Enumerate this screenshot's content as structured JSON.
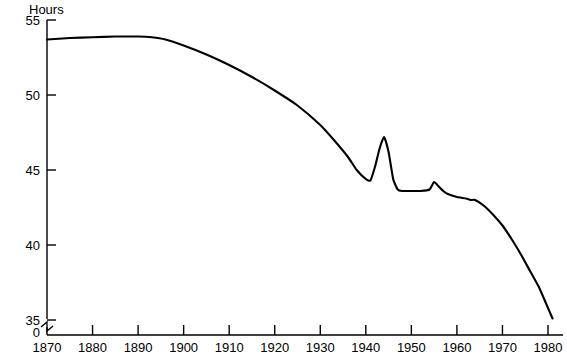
{
  "chart_data": {
    "type": "line",
    "title": "",
    "xlabel": "",
    "ylabel": "Hours",
    "xlim": [
      1870,
      1982
    ],
    "ylim": [
      35,
      55
    ],
    "grid": false,
    "legend": false,
    "axis_break": true,
    "axis_break_label": "0",
    "xticks": [
      1870,
      1880,
      1890,
      1900,
      1910,
      1920,
      1930,
      1940,
      1950,
      1960,
      1970,
      1980
    ],
    "xticklabels": [
      "1870",
      "1880",
      "1890",
      "1900",
      "1910",
      "1920",
      "1930",
      "1940",
      "1950",
      "1960",
      "1970",
      "1980"
    ],
    "yticks": [
      35,
      40,
      45,
      50,
      55
    ],
    "yticklabels": [
      "35",
      "40",
      "45",
      "50",
      "55"
    ],
    "series": [
      {
        "name": "Average weekly hours",
        "color": "#000000",
        "x": [
          1870,
          1875,
          1880,
          1885,
          1890,
          1893,
          1896,
          1900,
          1905,
          1910,
          1915,
          1920,
          1925,
          1930,
          1933,
          1936,
          1938,
          1940,
          1941,
          1942,
          1943,
          1944,
          1945,
          1946,
          1947,
          1948,
          1950,
          1952,
          1954,
          1955,
          1956,
          1957,
          1958,
          1960,
          1962,
          1963,
          1964,
          1966,
          1968,
          1970,
          1972,
          1974,
          1976,
          1978,
          1980,
          1981
        ],
        "y": [
          53.7,
          53.8,
          53.85,
          53.9,
          53.9,
          53.85,
          53.7,
          53.3,
          52.7,
          52.0,
          51.2,
          50.3,
          49.3,
          48.0,
          47.0,
          45.9,
          45.0,
          44.4,
          44.3,
          45.2,
          46.4,
          47.2,
          46.2,
          44.4,
          43.7,
          43.6,
          43.6,
          43.6,
          43.7,
          44.2,
          43.9,
          43.6,
          43.4,
          43.2,
          43.1,
          43.0,
          43.0,
          42.6,
          42.0,
          41.3,
          40.4,
          39.4,
          38.3,
          37.2,
          35.8,
          35.1
        ]
      }
    ],
    "annotations": []
  },
  "axis": {
    "y_axis_name": "Hours",
    "zero_mark": "0"
  }
}
